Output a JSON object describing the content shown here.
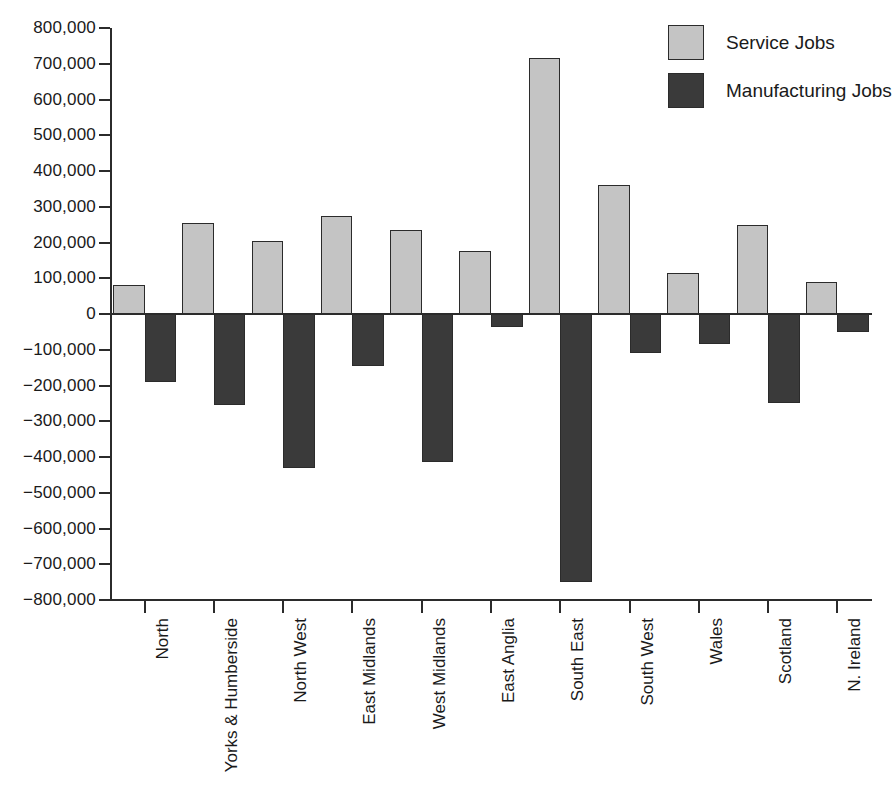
{
  "chart_data": {
    "type": "bar",
    "title": "",
    "subtitle": "",
    "xlabel": "",
    "ylabel": "",
    "ylim": [
      -800000,
      800000
    ],
    "ytick_step": 100000,
    "grid": false,
    "legend_position": "top-right",
    "orientation": "vertical",
    "bar_grouping": "adjacent-pairs",
    "categories": [
      "North",
      "Yorks & Humberside",
      "North West",
      "East Midlands",
      "West Midlands",
      "East Anglia",
      "South East",
      "South West",
      "Wales",
      "Scotland",
      "N. Ireland"
    ],
    "series": [
      {
        "name": "Service Jobs",
        "color": "#c4c4c4",
        "values": [
          80000,
          255000,
          205000,
          275000,
          235000,
          175000,
          715000,
          362000,
          115000,
          248000,
          90000
        ]
      },
      {
        "name": "Manufacturing Jobs",
        "color": "#3a3a3a",
        "values": [
          -190000,
          -255000,
          -430000,
          -145000,
          -415000,
          -35000,
          -750000,
          -110000,
          -85000,
          -250000,
          -50000
        ]
      }
    ],
    "ytick_labels": [
      "800,000",
      "700,000",
      "600,000",
      "500,000",
      "400,000",
      "300,000",
      "200,000",
      "100,000",
      "0",
      "−100,000",
      "−200,000",
      "−300,000",
      "−400,000",
      "−500,000",
      "−600,000",
      "−700,000",
      "−800,000"
    ],
    "ytick_values": [
      800000,
      700000,
      600000,
      500000,
      400000,
      300000,
      200000,
      100000,
      0,
      -100000,
      -200000,
      -300000,
      -400000,
      -500000,
      -600000,
      -700000,
      -800000
    ]
  },
  "legend": {
    "items": [
      {
        "label": "Service Jobs",
        "color": "#c4c4c4",
        "key": "service"
      },
      {
        "label": "Manufacturing Jobs",
        "color": "#3a3a3a",
        "key": "manufacturing"
      }
    ]
  },
  "colors": {
    "service": "#c4c4c4",
    "manufacturing": "#3a3a3a",
    "axis": "#2b2b2b",
    "text": "#1a1a1a",
    "background": "#ffffff"
  }
}
